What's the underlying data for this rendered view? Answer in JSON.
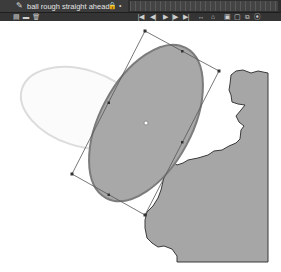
{
  "timeline": {
    "layer": {
      "name": "ball rough straight ahead",
      "icon": "motion-pencil-icon"
    },
    "layer_toggles": [
      "lock-icon",
      "dot-icon"
    ],
    "left_controls": [
      "new-layer-icon",
      "new-folder-icon",
      "delete-layer-icon"
    ],
    "playback_controls": [
      {
        "name": "go-to-first-frame",
        "glyph": "|◀"
      },
      {
        "name": "step-back",
        "glyph": "◀|"
      },
      {
        "name": "play",
        "glyph": "▶"
      },
      {
        "name": "step-forward",
        "glyph": "|▶"
      },
      {
        "name": "go-to-last-frame",
        "glyph": "▶|"
      }
    ],
    "right_controls": [
      {
        "name": "loop",
        "glyph": "↔"
      },
      {
        "name": "center-frame",
        "glyph": "⌂"
      },
      {
        "name": "onion-skin",
        "glyph": "▣"
      },
      {
        "name": "onion-skin-outlines",
        "glyph": "▢"
      },
      {
        "name": "edit-multiple-frames",
        "glyph": "⧉"
      },
      {
        "name": "modify-markers",
        "glyph": "⦿"
      }
    ]
  },
  "stage": {
    "colors": {
      "ball_fill": "#a8a8a8",
      "ball_stroke": "#7c7c7c",
      "onion_ghost": "#dcdcdc",
      "land_fill": "#a6a6a6",
      "land_stroke": "#3a3a3a",
      "transform_box": "#555555"
    },
    "objects": [
      "onion-skin-ghost-ellipse",
      "selected-ball-ellipse",
      "free-transform-box",
      "landmass"
    ]
  }
}
